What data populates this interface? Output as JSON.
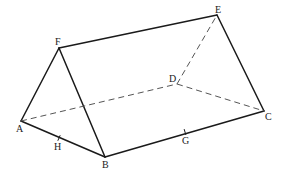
{
  "diagram": {
    "type": "triangular-prism",
    "vertices": {
      "A": {
        "label": "A",
        "x": 21,
        "y": 121,
        "lx": 16,
        "ly": 132
      },
      "B": {
        "label": "B",
        "x": 105,
        "y": 157,
        "lx": 102,
        "ly": 168
      },
      "C": {
        "label": "C",
        "x": 264,
        "y": 111,
        "lx": 265,
        "ly": 120
      },
      "D": {
        "label": "D",
        "x": 177,
        "y": 84,
        "lx": 169,
        "ly": 82
      },
      "E": {
        "label": "E",
        "x": 217,
        "y": 15,
        "lx": 215,
        "ly": 13
      },
      "F": {
        "label": "F",
        "x": 59,
        "y": 48,
        "lx": 55,
        "ly": 45
      }
    },
    "points_on_edges": {
      "H": {
        "label": "H",
        "edge": "AB",
        "x": 59,
        "y": 138,
        "lx": 54,
        "ly": 150
      },
      "G": {
        "label": "G",
        "edge": "BC",
        "x": 185,
        "y": 132,
        "lx": 182,
        "ly": 144
      }
    },
    "solid_edges": [
      "FE",
      "EC",
      "FA",
      "FB",
      "AB",
      "BC"
    ],
    "dashed_edges": [
      "AD",
      "DC",
      "DE"
    ],
    "colors": {
      "line": "#1a1a1a",
      "hidden_line": "#555555",
      "background": "#ffffff"
    }
  }
}
